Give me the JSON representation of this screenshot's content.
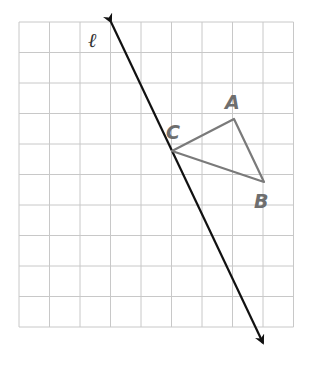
{
  "grid": {
    "origin_x": 19,
    "origin_y": 22,
    "cell": 30.5,
    "cols": 9,
    "rows": 10,
    "color": "#c8c8c8"
  },
  "line": {
    "label": "ℓ",
    "start": [
      111,
      22
    ],
    "end": [
      263,
      343
    ],
    "color": "#111111"
  },
  "triangle": {
    "color": "#7a7a7a",
    "points": {
      "A": [
        234,
        119
      ],
      "B": [
        264,
        182
      ],
      "C": [
        172,
        151
      ]
    },
    "labels": {
      "A": "A",
      "B": "B",
      "C": "C"
    }
  }
}
